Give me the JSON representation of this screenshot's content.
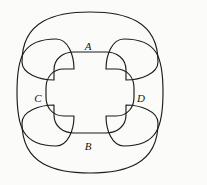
{
  "figure": {
    "kind": "four-overlapping-regions-diagram",
    "caption": "",
    "background_color": "#fbfbf9",
    "ink_color": "#1b1b1b",
    "width": 207,
    "height": 185
  },
  "regions": [
    {
      "id": "A",
      "label": "A",
      "position": "top",
      "orientation": "horizontal",
      "label_x": 88,
      "label_y": 46,
      "description": "wide horizontal rounded region spanning the top, pinched inward at center"
    },
    {
      "id": "B",
      "label": "B",
      "position": "bottom",
      "orientation": "horizontal",
      "label_x": 88,
      "label_y": 146,
      "description": "wide horizontal rounded region spanning the bottom, pinched inward at center"
    },
    {
      "id": "C",
      "label": "C",
      "position": "left",
      "orientation": "vertical",
      "label_x": 38,
      "label_y": 98,
      "description": "tall vertical rounded region spanning the left side, pinched inward at center"
    },
    {
      "id": "D",
      "label": "D",
      "position": "right",
      "orientation": "vertical",
      "label_x": 141,
      "label_y": 98,
      "description": "tall vertical rounded region spanning the right side, pinched inward at center"
    }
  ],
  "paths": {
    "region_a": "M 22,62 C 22,20 56,12 90,12 C 124,12 158,20 158,62 C 158,74 140,80 126,80 L 126,70 C 126,58 116,52 106,52 L 74,52 C 64,52 54,58 54,70 L 54,80 C 40,80 22,74 22,62 Z",
    "region_b": "M 22,123 C 22,165 56,173 90,173 C 124,173 158,165 158,123 C 158,111 140,105 126,105 L 126,115 C 126,127 116,133 106,133 L 74,133 C 64,133 54,127 54,115 L 54,105 C 40,105 22,111 22,123 Z",
    "region_c": "M 56,39 C 22,39 17,58 17,92 C 17,126 22,146 56,146 C 68,146 74,130 74,116 L 64,116 C 52,116 46,107 46,97 L 46,88 C 46,78 52,69 64,69 L 74,69 C 74,55 68,39 56,39 Z",
    "region_d": "M 124,39 C 158,39 163,58 163,92 C 163,126 158,146 124,146 C 112,146 106,130 106,116 L 116,116 C 128,116 134,107 134,97 L 134,88 C 134,78 128,69 116,69 L 106,69 C 106,55 112,39 124,39 Z"
  }
}
